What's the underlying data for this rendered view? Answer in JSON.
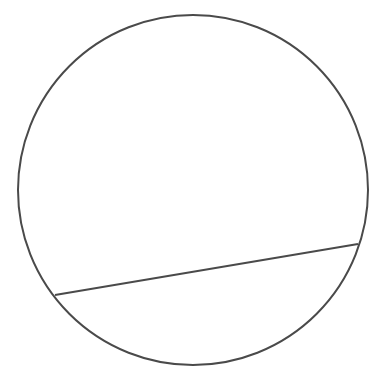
{
  "diagram": {
    "background": "#ffffff",
    "stroke_color": "#4a4a4a",
    "stroke_width": 2,
    "circle": {
      "cx": 193,
      "cy": 190,
      "r": 175
    },
    "chord": {
      "x1": 55,
      "y1": 295,
      "x2": 358,
      "y2": 244
    }
  }
}
